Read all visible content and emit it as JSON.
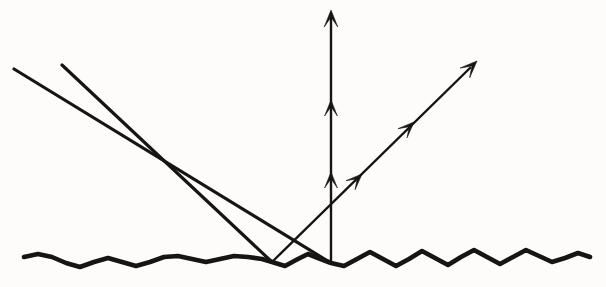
{
  "figure": {
    "background_color": "#fdfcfa",
    "ink_color": "#171513",
    "width": 606,
    "height": 287
  },
  "elements": {
    "incident_ray_left": {
      "name": "incident-ray-left",
      "description": "parallel incoming light ray (left)",
      "x1": 14,
      "y1": 69,
      "x2": 331,
      "y2": 263,
      "stroke_width": 3.2
    },
    "incident_ray_right": {
      "name": "incident-ray-right",
      "description": "parallel incoming light ray (right)",
      "x1": 62,
      "y1": 65,
      "x2": 272,
      "y2": 262,
      "stroke_width": 3.2
    },
    "reflected_ray_vertical": {
      "name": "reflected-ray-vertical",
      "description": "reflected ray leaving straight up",
      "x1": 331,
      "y1": 263,
      "x2": 331,
      "y2": 18,
      "stroke_width": 2.4,
      "arrowheads": [
        {
          "label": "tip-arrowhead",
          "x": 331,
          "y": 10,
          "angle": -90,
          "size": 17
        },
        {
          "label": "mid-arrowhead",
          "x": 331,
          "y": 100,
          "angle": -90,
          "size": 16
        },
        {
          "label": "low-arrowhead",
          "x": 331,
          "y": 172,
          "angle": -90,
          "size": 16
        }
      ]
    },
    "reflected_ray_diagonal": {
      "name": "reflected-ray-diagonal",
      "description": "reflected ray leaving up and to the right",
      "x1": 272,
      "y1": 262,
      "x2": 470,
      "y2": 68,
      "stroke_width": 2.4,
      "arrowheads": [
        {
          "label": "tip-arrowhead",
          "x": 477,
          "y": 61,
          "angle": -44.5,
          "size": 17
        },
        {
          "label": "mid-arrowhead",
          "x": 414,
          "y": 122,
          "angle": -44.5,
          "size": 16
        },
        {
          "label": "low-arrowhead",
          "x": 362,
          "y": 174,
          "angle": -44.5,
          "size": 16
        }
      ]
    },
    "rough_surface": {
      "name": "rough-surface-line",
      "description": "jagged rough reflecting surface",
      "stroke_width": 4.6,
      "points": [
        [
          24,
          257
        ],
        [
          38,
          254
        ],
        [
          52,
          257
        ],
        [
          66,
          263
        ],
        [
          80,
          267
        ],
        [
          94,
          262
        ],
        [
          108,
          258
        ],
        [
          122,
          262
        ],
        [
          136,
          266
        ],
        [
          150,
          262
        ],
        [
          164,
          257
        ],
        [
          178,
          256
        ],
        [
          192,
          259
        ],
        [
          206,
          262
        ],
        [
          220,
          259
        ],
        [
          234,
          256
        ],
        [
          248,
          257
        ],
        [
          262,
          259
        ],
        [
          272,
          262
        ],
        [
          285,
          266
        ],
        [
          296,
          260
        ],
        [
          308,
          254
        ],
        [
          318,
          258
        ],
        [
          331,
          263
        ],
        [
          344,
          266
        ],
        [
          357,
          259
        ],
        [
          370,
          252
        ],
        [
          383,
          259
        ],
        [
          396,
          266
        ],
        [
          409,
          259
        ],
        [
          422,
          251
        ],
        [
          435,
          258
        ],
        [
          448,
          265
        ],
        [
          461,
          257
        ],
        [
          474,
          250
        ],
        [
          487,
          257
        ],
        [
          500,
          264
        ],
        [
          513,
          257
        ],
        [
          526,
          250
        ],
        [
          539,
          256
        ],
        [
          552,
          262
        ],
        [
          565,
          258
        ],
        [
          578,
          253
        ],
        [
          590,
          257
        ]
      ]
    },
    "intersection_point": {
      "name": "ray-crossing-point",
      "x": 293,
      "y": 243
    }
  },
  "ghost_watermarks": [
    {
      "text": "",
      "x": 0,
      "y": 0
    }
  ]
}
